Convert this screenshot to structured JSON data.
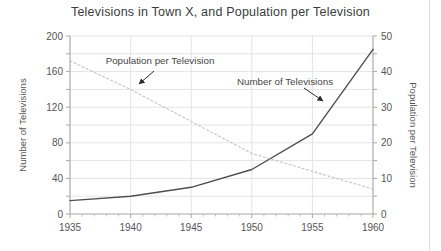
{
  "page": {
    "background": "#ffffff",
    "right_border_color": "#e8dada"
  },
  "chart_data": {
    "type": "line",
    "title": "Televisions in Town X, and Population per Television",
    "x": [
      1935,
      1940,
      1945,
      1950,
      1955,
      1960
    ],
    "series": [
      {
        "name": "Number of Televisions",
        "axis": "left",
        "values": [
          15,
          20,
          30,
          50,
          90,
          185
        ],
        "style": "solid",
        "color": "#4f4f4f",
        "width": 1.4
      },
      {
        "name": "Population per Television",
        "axis": "right",
        "values": [
          43,
          35,
          26,
          17,
          12,
          7
        ],
        "style": "dotted",
        "color": "#c3c3c3",
        "width": 1.1,
        "dash": "2 2.5"
      }
    ],
    "left_axis": {
      "label": "Number of Televisions",
      "min": 0,
      "max": 200,
      "tick_step": 40,
      "minor_step": 20,
      "ticks": [
        0,
        40,
        80,
        120,
        160,
        200
      ]
    },
    "right_axis": {
      "label": "Population per Television",
      "min": 0,
      "max": 50,
      "tick_step": 10,
      "minor_step": 5,
      "ticks": [
        0,
        10,
        20,
        30,
        40,
        50
      ]
    },
    "x_axis": {
      "min": 1935,
      "max": 1960,
      "tick_step": 5,
      "minor_step": 1,
      "ticks": [
        1935,
        1940,
        1945,
        1950,
        1955,
        1960
      ]
    },
    "grid": true,
    "legend": "none (inline annotations with arrows)",
    "annotations": [
      {
        "text": "Population per Television",
        "x": 160,
        "y": 64,
        "arrow": {
          "x1": 154,
          "y1": 71,
          "x2": 139,
          "y2": 84
        }
      },
      {
        "text": "Number of Televisions",
        "x": 285,
        "y": 85,
        "arrow": {
          "x1": 304,
          "y1": 88,
          "x2": 323,
          "y2": 101
        }
      }
    ],
    "colors": {
      "grid": "#e4e4e4",
      "axis": "#a8a8a8",
      "minor_tick": "#bfbfbf",
      "tick_text": "#555555",
      "title": "#3b3b3b",
      "annotation": "#474747",
      "arrow": "#2b2b2b"
    }
  }
}
